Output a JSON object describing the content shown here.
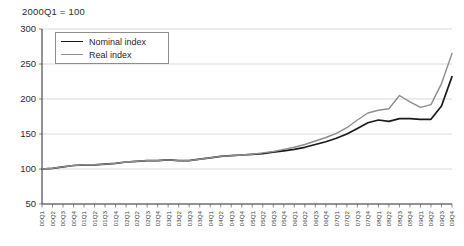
{
  "chart_data": {
    "type": "line",
    "title": "2000Q1 = 100",
    "xlabel": "",
    "ylabel": "",
    "ylim": [
      50,
      300
    ],
    "yticks": [
      50,
      100,
      150,
      200,
      250,
      300
    ],
    "grid": true,
    "legend_position": "top-left",
    "categories": [
      "00Q1",
      "00Q2",
      "00Q3",
      "00Q4",
      "01Q1",
      "01Q2",
      "01Q3",
      "01Q4",
      "02Q1",
      "02Q2",
      "02Q3",
      "02Q4",
      "03Q1",
      "03Q2",
      "03Q3",
      "03Q4",
      "04Q1",
      "04Q2",
      "04Q3",
      "04Q4",
      "05Q1",
      "05Q2",
      "05Q3",
      "05Q4",
      "06Q1",
      "06Q2",
      "06Q3",
      "06Q4",
      "07Q1",
      "07Q2",
      "07Q3",
      "07Q4",
      "08Q1",
      "08Q2",
      "08Q3",
      "08Q4",
      "09Q1",
      "09Q2",
      "09Q3",
      "09Q4"
    ],
    "series": [
      {
        "name": "Nominal index",
        "color": "#1a1a1a",
        "width": 1.7,
        "values": [
          100,
          101,
          103,
          105,
          106,
          106,
          107,
          108,
          110,
          111,
          112,
          112,
          113,
          112,
          112,
          114,
          116,
          118,
          119,
          120,
          121,
          122,
          124,
          126,
          128,
          131,
          135,
          139,
          144,
          150,
          158,
          166,
          170,
          168,
          172,
          172,
          171,
          171,
          190,
          232
        ]
      },
      {
        "name": "Real index",
        "color": "#8d8d8d",
        "width": 1.4,
        "values": [
          100,
          101,
          103,
          105,
          106,
          106,
          107,
          108,
          110,
          111,
          112,
          112,
          113,
          112,
          112,
          114,
          116,
          118,
          119,
          120,
          121,
          123,
          125,
          128,
          131,
          135,
          140,
          145,
          151,
          159,
          170,
          180,
          184,
          186,
          205,
          196,
          188,
          192,
          222,
          265
        ]
      }
    ]
  },
  "legend": {
    "items": [
      {
        "label": "Nominal index"
      },
      {
        "label": "Real index"
      }
    ]
  }
}
